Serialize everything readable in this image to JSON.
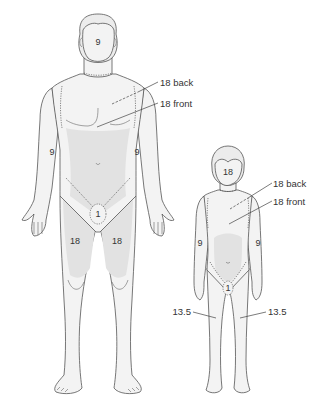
{
  "figure": {
    "adult": {
      "head": "9",
      "trunk_back": "18 back",
      "trunk_front": "18 front",
      "left_arm": "9",
      "right_arm": "9",
      "perineum": "1",
      "left_leg": "18",
      "right_leg": "18"
    },
    "child": {
      "head": "18",
      "trunk_back": "18 back",
      "trunk_front": "18 front",
      "left_arm": "9",
      "right_arm": "9",
      "perineum": "1",
      "left_leg": "13.5",
      "right_leg": "13.5"
    }
  },
  "colors": {
    "outline": "#555555",
    "skin": "#f3f3f3",
    "shade": "#e2e2e2",
    "text": "#333333"
  }
}
